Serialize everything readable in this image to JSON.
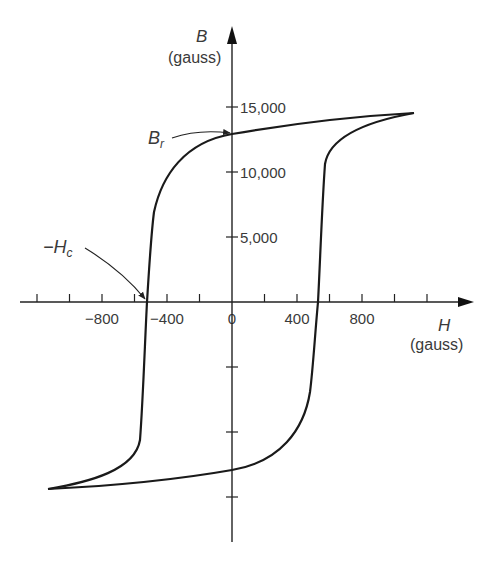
{
  "chart_data": {
    "type": "line",
    "title": "",
    "xlabel": "H",
    "xlabel_unit": "(gauss)",
    "ylabel": "B",
    "ylabel_unit": "(gauss)",
    "x_ticks": [
      -1200,
      -1000,
      -800,
      -600,
      -400,
      -200,
      0,
      200,
      400,
      600,
      800,
      1000,
      1200
    ],
    "x_tick_labels": [
      {
        "value": -800,
        "label": "−800"
      },
      {
        "value": -400,
        "label": "−400"
      },
      {
        "value": 0,
        "label": "0"
      },
      {
        "value": 400,
        "label": "400"
      },
      {
        "value": 800,
        "label": "800"
      }
    ],
    "y_ticks": [
      15000,
      10000,
      5000,
      -5000,
      -10000,
      -15000
    ],
    "y_tick_labels": [
      {
        "value": 15000,
        "label": "15,000"
      },
      {
        "value": 10000,
        "label": "10,000"
      },
      {
        "value": 5000,
        "label": "5,000"
      }
    ],
    "xlim": [
      -1200,
      1450
    ],
    "ylim": [
      -20000,
      20500
    ],
    "grid": false,
    "legend": null,
    "series": [
      {
        "name": "descending branch",
        "points": [
          [
            1120,
            14600
          ],
          [
            800,
            14300
          ],
          [
            400,
            13800
          ],
          [
            0,
            13000
          ],
          [
            -200,
            12100
          ],
          [
            -350,
            10600
          ],
          [
            -450,
            8200
          ],
          [
            -490,
            6000
          ],
          [
            -510,
            3000
          ],
          [
            -530,
            0
          ],
          [
            -545,
            -3000
          ],
          [
            -560,
            -6000
          ],
          [
            -580,
            -8800
          ],
          [
            -700,
            -11000
          ],
          [
            -900,
            -13000
          ],
          [
            -1140,
            -14500
          ]
        ]
      },
      {
        "name": "ascending branch",
        "points": [
          [
            -1140,
            -14500
          ],
          [
            -800,
            -14300
          ],
          [
            -400,
            -13800
          ],
          [
            0,
            -13000
          ],
          [
            200,
            -12100
          ],
          [
            350,
            -10600
          ],
          [
            450,
            -8200
          ],
          [
            490,
            -6000
          ],
          [
            510,
            -3000
          ],
          [
            530,
            0
          ],
          [
            545,
            3000
          ],
          [
            560,
            6000
          ],
          [
            580,
            8800
          ],
          [
            700,
            11000
          ],
          [
            900,
            13000
          ],
          [
            1120,
            14600
          ]
        ]
      }
    ],
    "annotations": [
      {
        "label": "B",
        "subscript": "r",
        "meaning": "remanence",
        "x": 0,
        "y": 13000
      },
      {
        "label": "−H",
        "subscript": "c",
        "meaning": "coercivity",
        "x": -530,
        "y": 0
      }
    ]
  }
}
